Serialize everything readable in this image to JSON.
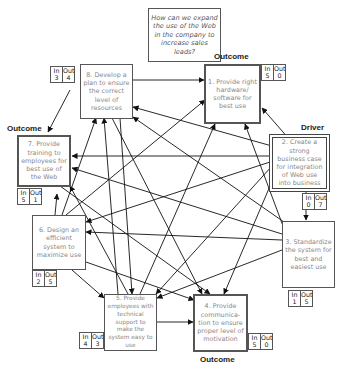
{
  "question": "How can we expand the use of the Web in the company to increase sales leads?",
  "io_labels": {
    "in": "In",
    "out": "Out"
  },
  "nodes": [
    {
      "id": 1,
      "text": "1. Provide right hardware/ software for best use",
      "in": "5",
      "out": "0",
      "role": "Outcome"
    },
    {
      "id": 2,
      "text": "2. Create a strong business case for integration of Web use into business",
      "in": "0",
      "out": "7",
      "role": "Driver"
    },
    {
      "id": 3,
      "text": "3. Standardize the system for best and easiest use",
      "in": "1",
      "out": "5",
      "role": ""
    },
    {
      "id": 4,
      "text": "4. Provide communica-tion to ensure proper level of motivation",
      "in": "5",
      "out": "0",
      "role": "Outcome"
    },
    {
      "id": 5,
      "text": "5. Provide employees with technical support to make the system easy to use",
      "in": "4",
      "out": "3",
      "role": ""
    },
    {
      "id": 6,
      "text": "6. Design an efficient system to maximize use",
      "in": "2",
      "out": "5",
      "role": ""
    },
    {
      "id": 7,
      "text": "7. Provide training to employees for best use of the Web",
      "in": "5",
      "out": "1",
      "role": "Outcome"
    },
    {
      "id": 8,
      "text": "8. Develop a plan to ensure the correct level of resources",
      "in": "3",
      "out": "4",
      "role": ""
    }
  ],
  "tags": {
    "n1": "Outcome",
    "n2": "Driver",
    "n4": "Outcome",
    "n7": "Outcome"
  },
  "arrows": [
    {
      "from": 8,
      "to": 7,
      "x1": 70,
      "y1": 90,
      "x2": 48,
      "y2": 132
    },
    {
      "from": 2,
      "to": 1,
      "x1": 290,
      "y1": 140,
      "x2": 262,
      "y2": 108
    },
    {
      "from": 2,
      "to": 8,
      "x1": 272,
      "y1": 146,
      "x2": 133,
      "y2": 107
    },
    {
      "from": 2,
      "to": 7,
      "x1": 270,
      "y1": 156,
      "x2": 72,
      "y2": 156
    },
    {
      "from": 2,
      "to": 6,
      "x1": 270,
      "y1": 162,
      "x2": 86,
      "y2": 222
    },
    {
      "from": 2,
      "to": 3,
      "x1": 306,
      "y1": 190,
      "x2": 306,
      "y2": 220
    },
    {
      "from": 2,
      "to": 5,
      "x1": 272,
      "y1": 166,
      "x2": 156,
      "y2": 294
    },
    {
      "from": 2,
      "to": 4,
      "x1": 276,
      "y1": 172,
      "x2": 224,
      "y2": 294
    },
    {
      "from": 3,
      "to": 1,
      "x1": 283,
      "y1": 226,
      "x2": 245,
      "y2": 124
    },
    {
      "from": 3,
      "to": 7,
      "x1": 282,
      "y1": 234,
      "x2": 72,
      "y2": 168
    },
    {
      "from": 3,
      "to": 6,
      "x1": 282,
      "y1": 240,
      "x2": 86,
      "y2": 232
    },
    {
      "from": 3,
      "to": 8,
      "x1": 284,
      "y1": 222,
      "x2": 133,
      "y2": 117
    },
    {
      "from": 3,
      "to": 5,
      "x1": 282,
      "y1": 250,
      "x2": 157,
      "y2": 298
    },
    {
      "from": 6,
      "to": 1,
      "x1": 66,
      "y1": 215,
      "x2": 205,
      "y2": 100
    },
    {
      "from": 6,
      "to": 7,
      "x1": 55,
      "y1": 215,
      "x2": 57,
      "y2": 194
    },
    {
      "from": 6,
      "to": 4,
      "x1": 86,
      "y1": 262,
      "x2": 194,
      "y2": 300
    },
    {
      "from": 6,
      "to": 5,
      "x1": 72,
      "y1": 270,
      "x2": 104,
      "y2": 298
    },
    {
      "from": 6,
      "to": 8,
      "x1": 62,
      "y1": 215,
      "x2": 96,
      "y2": 118
    },
    {
      "from": 5,
      "to": 4,
      "x1": 157,
      "y1": 322,
      "x2": 193,
      "y2": 322
    },
    {
      "from": 5,
      "to": 1,
      "x1": 140,
      "y1": 294,
      "x2": 215,
      "y2": 124
    },
    {
      "from": 5,
      "to": 8,
      "x1": 118,
      "y1": 294,
      "x2": 104,
      "y2": 118
    },
    {
      "from": 5,
      "to": 7,
      "x1": 128,
      "y1": 294,
      "x2": 70,
      "y2": 186
    },
    {
      "from": 8,
      "to": 4,
      "x1": 112,
      "y1": 118,
      "x2": 202,
      "y2": 294
    },
    {
      "from": 8,
      "to": 1,
      "x1": 132,
      "y1": 80,
      "x2": 204,
      "y2": 80
    },
    {
      "from": 8,
      "to": 5,
      "x1": 120,
      "y1": 118,
      "x2": 132,
      "y2": 294
    },
    {
      "from": 7,
      "to": 4,
      "x1": 60,
      "y1": 186,
      "x2": 210,
      "y2": 294
    }
  ]
}
